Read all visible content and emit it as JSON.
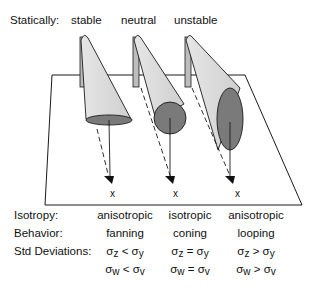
{
  "header": {
    "statically_label": "Statically:",
    "columns": [
      "stable",
      "neutral",
      "unstable"
    ]
  },
  "diagram": {
    "plume_marker": "x",
    "plumes": [
      {
        "stability": "stable",
        "cross_section": "flat ellipse"
      },
      {
        "stability": "neutral",
        "cross_section": "circle"
      },
      {
        "stability": "unstable",
        "cross_section": "tall ellipse"
      }
    ],
    "colors": {
      "plume_body": "#d9d9d9",
      "cross_section": "#7a7a7a",
      "stroke": "#1a1a1a"
    }
  },
  "rows": {
    "isotropy": {
      "label": "Isotropy:",
      "values": [
        "anisotropic",
        "isotropic",
        "anisotropic"
      ]
    },
    "behavior": {
      "label": "Behavior:",
      "values": [
        "fanning",
        "coning",
        "looping"
      ]
    },
    "std_deviations": {
      "label": "Std Deviations:",
      "line1": [
        {
          "a": "z",
          "op": "<",
          "b": "y"
        },
        {
          "a": "z",
          "op": "=",
          "b": "y"
        },
        {
          "a": "z",
          "op": ">",
          "b": "y"
        }
      ],
      "line2": [
        {
          "a": "w",
          "op": "<",
          "b": "v"
        },
        {
          "a": "w",
          "op": "=",
          "b": "v"
        },
        {
          "a": "w",
          "op": ">",
          "b": "v"
        }
      ],
      "sigma": "σ"
    }
  }
}
